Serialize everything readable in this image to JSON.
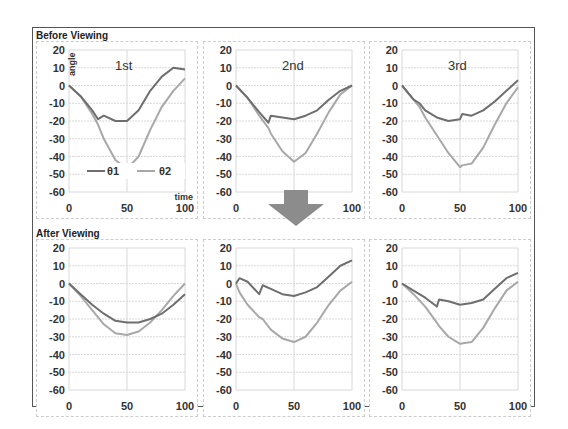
{
  "sections": {
    "before": "Before Viewing",
    "after": "After Viewing"
  },
  "axes": {
    "ylabel": "angle",
    "xlabel": "time",
    "yticks": [
      "20",
      "10",
      "0",
      "-10",
      "-20",
      "-30",
      "-40",
      "-50",
      "-60"
    ],
    "xticks": [
      "0",
      "50",
      "100"
    ]
  },
  "legend": {
    "series1": "θ1",
    "series2": "θ2"
  },
  "colors": {
    "theta1": "#6e6e6e",
    "theta2": "#a8a8a8",
    "grid": "#d8d8d8",
    "arrow": "#8c8c8c"
  },
  "panels": [
    {
      "title": "1st"
    },
    {
      "title": "2nd"
    },
    {
      "title": "3rd"
    },
    {
      "title": ""
    },
    {
      "title": ""
    },
    {
      "title": ""
    }
  ],
  "chart_data": [
    {
      "type": "line",
      "title": "Before Viewing — 1st",
      "xlabel": "time",
      "ylabel": "angle",
      "xlim": [
        0,
        100
      ],
      "ylim": [
        -60,
        20
      ],
      "x": [
        0,
        10,
        20,
        25,
        30,
        40,
        50,
        60,
        70,
        80,
        90,
        100
      ],
      "series": [
        {
          "name": "θ1",
          "values": [
            0,
            -6,
            -14,
            -19,
            -17,
            -20,
            -20,
            -14,
            -3,
            5,
            10,
            9
          ]
        },
        {
          "name": "θ2",
          "values": [
            0,
            -6,
            -16,
            -22,
            -30,
            -42,
            -47,
            -40,
            -25,
            -12,
            -3,
            4
          ]
        }
      ]
    },
    {
      "type": "line",
      "title": "Before Viewing — 2nd",
      "xlim": [
        0,
        100
      ],
      "ylim": [
        -60,
        20
      ],
      "x": [
        0,
        10,
        20,
        28,
        30,
        40,
        50,
        60,
        70,
        80,
        90,
        100
      ],
      "series": [
        {
          "name": "θ1",
          "values": [
            0,
            -7,
            -15,
            -21,
            -17,
            -18,
            -19,
            -17,
            -14,
            -8,
            -3,
            0
          ]
        },
        {
          "name": "θ2",
          "values": [
            0,
            -7,
            -17,
            -24,
            -27,
            -37,
            -43,
            -38,
            -27,
            -15,
            -5,
            0
          ]
        }
      ]
    },
    {
      "type": "line",
      "title": "Before Viewing — 3rd",
      "xlim": [
        0,
        100
      ],
      "ylim": [
        -60,
        20
      ],
      "x": [
        0,
        10,
        15,
        20,
        30,
        40,
        50,
        52,
        60,
        70,
        80,
        90,
        100
      ],
      "series": [
        {
          "name": "θ1",
          "values": [
            0,
            -8,
            -10,
            -14,
            -18,
            -20,
            -19,
            -16,
            -17,
            -14,
            -9,
            -3,
            3
          ]
        },
        {
          "name": "θ2",
          "values": [
            0,
            -8,
            -12,
            -18,
            -28,
            -38,
            -46,
            -45,
            -44,
            -35,
            -22,
            -10,
            -1
          ]
        }
      ]
    },
    {
      "type": "line",
      "title": "After Viewing — 1",
      "xlim": [
        0,
        100
      ],
      "ylim": [
        -60,
        20
      ],
      "x": [
        0,
        10,
        20,
        30,
        40,
        50,
        60,
        70,
        80,
        90,
        100
      ],
      "series": [
        {
          "name": "θ1",
          "values": [
            0,
            -6,
            -12,
            -17,
            -21,
            -22,
            -22,
            -20,
            -17,
            -12,
            -6
          ]
        },
        {
          "name": "θ2",
          "values": [
            0,
            -7,
            -15,
            -23,
            -28,
            -29,
            -27,
            -22,
            -15,
            -7,
            0
          ]
        }
      ]
    },
    {
      "type": "line",
      "title": "After Viewing — 2",
      "xlim": [
        0,
        100
      ],
      "ylim": [
        -60,
        20
      ],
      "x": [
        0,
        3,
        10,
        20,
        23,
        30,
        40,
        50,
        60,
        70,
        80,
        90,
        100
      ],
      "series": [
        {
          "name": "θ1",
          "values": [
            0,
            3,
            1,
            -6,
            -1,
            -3,
            -6,
            -7,
            -5,
            -2,
            4,
            10,
            13
          ]
        },
        {
          "name": "θ2",
          "values": [
            0,
            -5,
            -12,
            -19,
            -20,
            -26,
            -31,
            -33,
            -30,
            -22,
            -12,
            -4,
            1
          ]
        }
      ]
    },
    {
      "type": "line",
      "title": "After Viewing — 3",
      "xlim": [
        0,
        100
      ],
      "ylim": [
        -60,
        20
      ],
      "x": [
        0,
        10,
        20,
        30,
        32,
        40,
        50,
        60,
        70,
        80,
        90,
        100
      ],
      "series": [
        {
          "name": "θ1",
          "values": [
            0,
            -4,
            -8,
            -13,
            -9,
            -10,
            -12,
            -11,
            -9,
            -3,
            3,
            6
          ]
        },
        {
          "name": "θ2",
          "values": [
            0,
            -6,
            -13,
            -22,
            -24,
            -30,
            -34,
            -33,
            -25,
            -14,
            -4,
            1
          ]
        }
      ]
    }
  ]
}
